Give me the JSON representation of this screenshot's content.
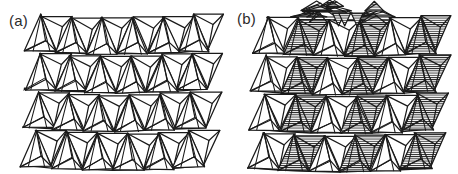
{
  "figure": {
    "background_color": "#ffffff",
    "stroke_color": "#1a1a1a",
    "hatch_color": "#1a1a1a",
    "width": 458,
    "height": 174,
    "panels": [
      {
        "id": "a",
        "label": "(a)",
        "label_x": 9,
        "label_y": 13,
        "description": "Polyhedral framework of corner-sharing tetrahedra, all drawn as open (unshaded) outlines",
        "rows": 4,
        "columns": 6,
        "shaded_columns": [],
        "origin_x": 26,
        "origin_y": 14,
        "cell_width": 30.5,
        "row_height": 38.0,
        "tetra_half_width": 15.5,
        "tetra_height": 36.0,
        "row_shear": -1.6,
        "row_dip": 4.0
      },
      {
        "id": "b",
        "label": "(b)",
        "label_x": 8,
        "label_y": 11,
        "description": "Same tetrahedral framework with three vertical columns of horizontally hatched (shaded) tetrahedra, showing inverted tetrahedra stacked apex-to-apex",
        "rows": 4,
        "columns": 6,
        "shaded_columns": [
          1,
          3,
          5
        ],
        "origin_x": 24,
        "origin_y": 16,
        "cell_width": 30.5,
        "row_height": 38.0,
        "tetra_half_width": 15.5,
        "tetra_height": 36.0,
        "row_shear": -1.6,
        "row_dip": 4.0,
        "hatch_spacing": 2.2,
        "hatch_line_width": 1.0,
        "top_cluster": true
      }
    ]
  }
}
